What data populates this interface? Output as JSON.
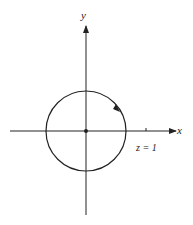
{
  "diagram": {
    "axes": {
      "x_label": "x",
      "y_label": "y"
    },
    "origin": {
      "x": 86,
      "y": 131
    },
    "circle": {
      "cx": 86,
      "cy": 131,
      "r": 40,
      "direction": "counterclockwise"
    },
    "tick": {
      "x": 146,
      "label": "z = 1"
    },
    "colors": {
      "stroke": "#222222",
      "background": "#ffffff"
    }
  }
}
